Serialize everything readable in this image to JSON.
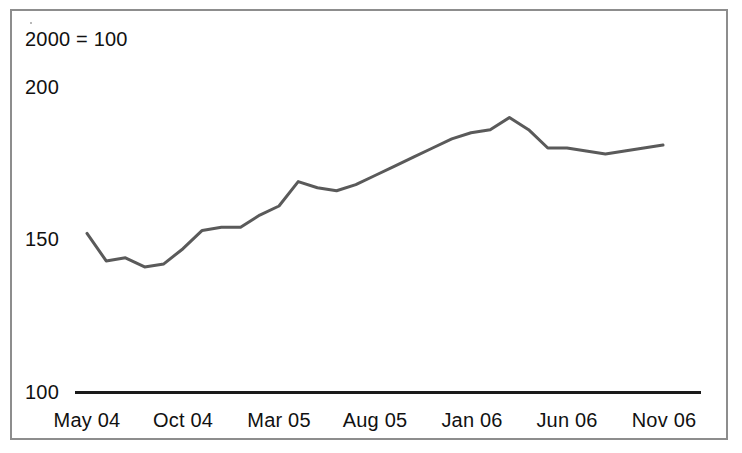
{
  "figure": {
    "background_color": "#ffffff",
    "border_color": "#8d8d8d",
    "base_note": "2000 = 100"
  },
  "axis": {
    "y_ticks": [
      "200",
      "150",
      "100"
    ],
    "x_ticks": [
      "May 04",
      "Oct 04",
      "Mar 05",
      "Aug 05",
      "Jan 06",
      "Jun 06",
      "Nov 06"
    ],
    "axis_line_color": "#1a1a1a"
  },
  "chart_data": {
    "type": "line",
    "title": "",
    "subtitle": "",
    "annotations": [
      "2000 = 100"
    ],
    "xlabel": "",
    "ylabel": "",
    "ylim": [
      100,
      200
    ],
    "yticks": [
      100,
      150,
      200
    ],
    "grid": false,
    "legend": null,
    "legend_position": "none",
    "line_color": "#5a5a5a",
    "line_width": 3,
    "x_tick_labels": [
      "May 04",
      "Oct 04",
      "Mar 05",
      "Aug 05",
      "Jan 06",
      "Jun 06",
      "Nov 06"
    ],
    "x": [
      "May 04",
      "Jun 04",
      "Jul 04",
      "Aug 04",
      "Sep 04",
      "Oct 04",
      "Nov 04",
      "Dec 04",
      "Jan 05",
      "Feb 05",
      "Mar 05",
      "Apr 05",
      "May 05",
      "Jun 05",
      "Jul 05",
      "Aug 05",
      "Sep 05",
      "Oct 05",
      "Nov 05",
      "Dec 05",
      "Jan 06",
      "Feb 06",
      "Mar 06",
      "Apr 06",
      "May 06",
      "Jun 06",
      "Jul 06",
      "Aug 06",
      "Sep 06",
      "Oct 06",
      "Nov 06"
    ],
    "values": [
      152,
      143,
      144,
      141,
      142,
      147,
      153,
      154,
      154,
      158,
      161,
      169,
      167,
      166,
      168,
      171,
      174,
      177,
      180,
      183,
      185,
      186,
      190,
      186,
      180,
      180,
      179,
      178,
      179,
      180,
      181
    ],
    "series": [
      {
        "name": "Index",
        "values": [
          152,
          143,
          144,
          141,
          142,
          147,
          153,
          154,
          154,
          158,
          161,
          169,
          167,
          166,
          168,
          171,
          174,
          177,
          180,
          183,
          185,
          186,
          190,
          186,
          180,
          180,
          179,
          178,
          179,
          180,
          181
        ]
      }
    ]
  }
}
